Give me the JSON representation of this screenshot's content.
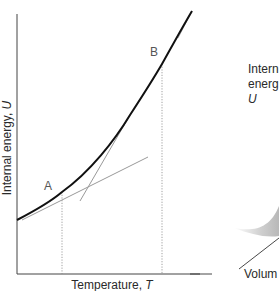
{
  "left_panel": {
    "y_axis_label": "Internal energy, ",
    "y_axis_var": "U",
    "x_axis_label": "Temperature, ",
    "x_axis_var": "T",
    "points": [
      {
        "label": "A"
      },
      {
        "label": "B"
      }
    ]
  },
  "right_panel": {
    "z_label_line1": "Intern",
    "z_label_line2": "energ",
    "z_label_line3": "U",
    "x_label": "Volum"
  },
  "colors": {
    "curve": "#111111",
    "tangent": "#9a9a9a",
    "dotted": "#8a8a8a",
    "axis": "#333333",
    "surface": "#c8c8c8"
  }
}
